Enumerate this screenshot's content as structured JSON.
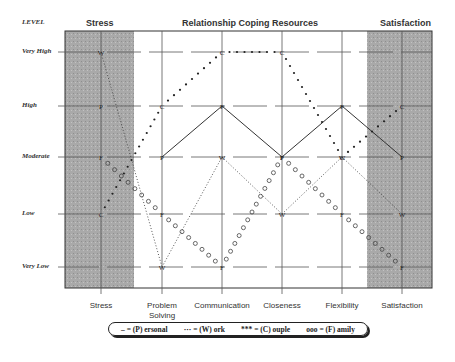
{
  "chart_data": {
    "type": "line",
    "title": "Relationship Coping Resources",
    "headers": {
      "level": "LEVEL",
      "left": "Stress",
      "center": "Relationship Coping Resources",
      "right": "Satisfaction"
    },
    "ylabel": "LEVEL",
    "y_levels": [
      "Very Low",
      "Low",
      "Moderate",
      "High",
      "Very High"
    ],
    "categories": [
      "Stress",
      "Problem Solving",
      "Communication",
      "Closeness",
      "Flexibility",
      "Satisfaction"
    ],
    "series": [
      {
        "name": "(P)ersonal",
        "marker": "P",
        "style": "solid",
        "values": [
          "High",
          "Moderate",
          "High",
          "Moderate",
          "High",
          "Moderate"
        ]
      },
      {
        "name": "(W)ork",
        "marker": "W",
        "style": "dotted",
        "values": [
          "Very High",
          "Very Low",
          "Moderate",
          "Low",
          "Moderate",
          "Low"
        ]
      },
      {
        "name": "(C)ouple",
        "marker": "C",
        "style": "stars",
        "values": [
          "Low",
          "High",
          "Very High",
          "Very High",
          "Moderate",
          "High"
        ]
      },
      {
        "name": "(F)amily",
        "marker": "F",
        "style": "circles",
        "values": [
          "Moderate",
          "Low",
          "Very Low",
          "Moderate",
          "Low",
          "Very Low"
        ]
      }
    ],
    "shaded_columns": [
      "Stress",
      "Satisfaction"
    ],
    "grid": true,
    "legend": {
      "position": "bottom",
      "entries": [
        "– = (P) ersonal",
        "··· = (W) ork",
        "*** = (C) ouple",
        "ooo = (F) amily"
      ]
    }
  },
  "labels": {
    "level": "LEVEL",
    "stress_header": "Stress",
    "center_header": "Relationship Coping Resources",
    "sat_header": "Satisfaction",
    "y": [
      "Very High",
      "High",
      "Moderate",
      "Low",
      "Very Low"
    ],
    "x": [
      "Stress",
      "Problem Solving",
      "Communication",
      "Closeness",
      "Flexibility",
      "Satisfaction"
    ],
    "legend": [
      "– = (P) ersonal",
      "··· = (W) ork",
      "*** = (C) ouple",
      "ooo = (F) amily"
    ]
  }
}
